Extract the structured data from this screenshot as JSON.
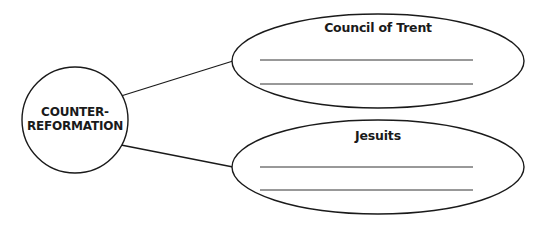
{
  "diagram": {
    "type": "concept-web",
    "colors": {
      "stroke": "#1a1a1a",
      "text": "#1a1a1a",
      "background": "#ffffff",
      "answer_line": "#333333"
    },
    "center": {
      "line1": "COUNTER-",
      "line2": "REFORMATION"
    },
    "nodes": [
      {
        "title": "Council of Trent",
        "answer_lines": 2
      },
      {
        "title": "Jesuits",
        "answer_lines": 2
      }
    ]
  }
}
